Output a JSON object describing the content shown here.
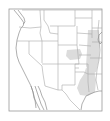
{
  "map": {
    "title": "",
    "region": "Western and Central United States",
    "frame": {
      "x": 9,
      "y": 9,
      "width": 93,
      "height": 102
    },
    "colors": {
      "background": "#ffffff",
      "border": "#a8a8a8",
      "shade": "#dcdcdc"
    },
    "shaded_regions": [
      {
        "name": "Northeastern Kansas / Missouri area"
      },
      {
        "name": "Iowa / Illinois / Missouri column"
      },
      {
        "name": "East Texas / Louisiana area"
      }
    ]
  }
}
